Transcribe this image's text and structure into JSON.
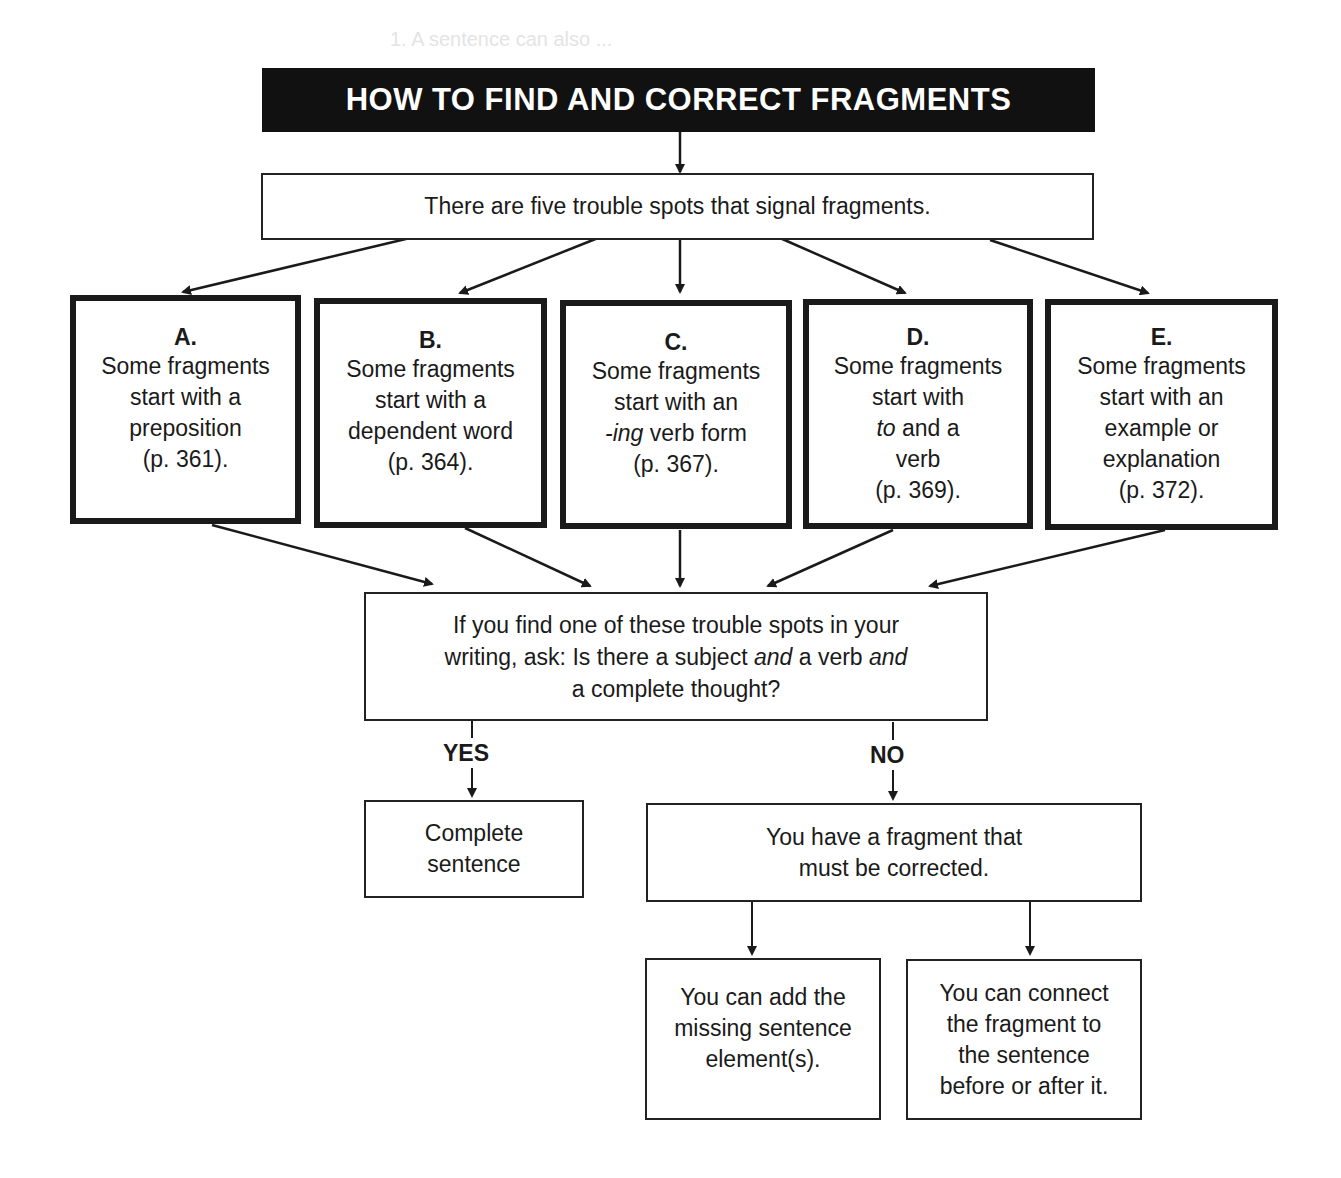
{
  "title": "HOW TO FIND AND CORRECT FRAGMENTS",
  "intro": "There are five trouble spots that signal fragments.",
  "trouble_spots": [
    {
      "letter": "A.",
      "lines": [
        "Some fragments",
        "start with a",
        "preposition",
        "(p. 361)."
      ]
    },
    {
      "letter": "B.",
      "lines": [
        "Some fragments",
        "start with a",
        "dependent word",
        "(p. 364)."
      ]
    },
    {
      "letter": "C.",
      "lines": [
        "Some fragments",
        "start with an",
        "-ing",
        " verb form",
        "(p. 367)."
      ]
    },
    {
      "letter": "D.",
      "lines": [
        "Some fragments",
        "start with",
        "to",
        " and a",
        "verb",
        "(p. 369)."
      ]
    },
    {
      "letter": "E.",
      "lines": [
        "Some fragments",
        "start with an",
        "example or",
        "explanation",
        "(p. 372)."
      ]
    }
  ],
  "question": {
    "line1": "If you find one of these trouble spots in your",
    "line2_a": "writing, ask: Is there a subject ",
    "line2_b": "and",
    "line2_c": " a verb ",
    "line2_d": "and",
    "line3": "a complete thought?"
  },
  "yes_label": "YES",
  "no_label": "NO",
  "complete": [
    "Complete",
    "sentence"
  ],
  "fragment": [
    "You have a fragment that",
    "must be corrected."
  ],
  "fix_add": [
    "You can add the",
    "missing sentence",
    "element(s)."
  ],
  "fix_connect": [
    "You can connect",
    "the fragment to",
    "the sentence",
    "before or after it."
  ],
  "background_bleed": "1. A sentence can also ..."
}
